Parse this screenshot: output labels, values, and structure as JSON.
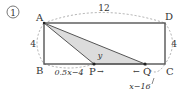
{
  "problem_number": "①",
  "points": {
    "A": "A",
    "B": "B",
    "C": "C",
    "D": "D",
    "P": "P",
    "Q": "Q"
  },
  "dimensions": {
    "top_length": "12",
    "left_height": "4",
    "right_height": "4"
  },
  "region_label": "y",
  "segments": {
    "BP": "0.5x−4",
    "QC": "x−16"
  },
  "motion": {
    "P_arrow": "→",
    "Q_arrow": "←"
  },
  "colors": {
    "rect_stroke": "#555555",
    "shade_fill": "#dcdcdc",
    "dashed": "#999999"
  }
}
